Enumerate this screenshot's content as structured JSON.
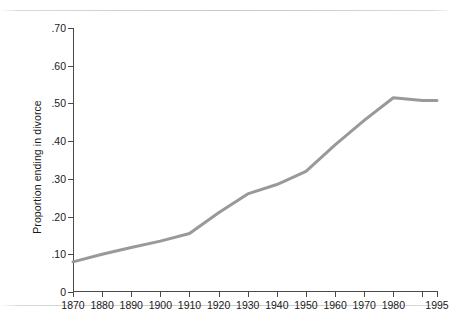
{
  "figure": {
    "background": "#ffffff",
    "rules": {
      "top_label": "page-rule-top",
      "bottom_label": "page-rule-bottom"
    }
  },
  "chart_data": {
    "type": "line",
    "title": "",
    "xlabel": "",
    "ylabel": "Proportion ending in divorce",
    "xlim": [
      1870,
      1995
    ],
    "ylim": [
      0,
      0.7
    ],
    "grid": false,
    "legend": null,
    "line_color": "#999999",
    "line_width": 3,
    "axis_color": "#4a4a4a",
    "x_tick_labels": [
      "1870",
      "1880",
      "1890",
      "1900",
      "1910",
      "1920",
      "1930",
      "1940",
      "1950",
      "1960",
      "1970",
      "1980",
      "1995"
    ],
    "x_tick_values": [
      1870,
      1880,
      1890,
      1900,
      1910,
      1920,
      1930,
      1940,
      1950,
      1960,
      1970,
      1980,
      1995
    ],
    "x_minor_tick_values": [
      1990
    ],
    "y_tick_labels": [
      "0",
      ".10",
      ".20",
      ".30",
      ".40",
      ".50",
      ".60",
      ".70"
    ],
    "y_tick_values": [
      0,
      0.1,
      0.2,
      0.3,
      0.4,
      0.5,
      0.6,
      0.7
    ],
    "x": [
      1870,
      1880,
      1890,
      1900,
      1910,
      1920,
      1930,
      1940,
      1950,
      1960,
      1970,
      1980,
      1990,
      1995
    ],
    "values": [
      0.08,
      0.1,
      0.118,
      0.135,
      0.155,
      0.21,
      0.26,
      0.285,
      0.32,
      0.39,
      0.455,
      0.515,
      0.508,
      0.508
    ],
    "series": [
      {
        "name": "Proportion ending in divorce",
        "values": [
          0.08,
          0.1,
          0.118,
          0.135,
          0.155,
          0.21,
          0.26,
          0.285,
          0.32,
          0.39,
          0.455,
          0.515,
          0.508,
          0.508
        ]
      }
    ]
  }
}
